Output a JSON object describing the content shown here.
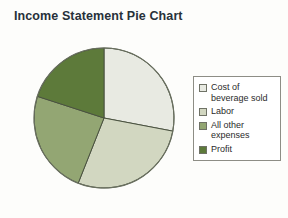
{
  "chart_data": {
    "type": "pie",
    "title": "Income Statement Pie Chart",
    "xlabel": "",
    "ylabel": "",
    "legend_position": "right",
    "grid": false,
    "start_angle_deg": 0,
    "direction": "clockwise",
    "categories": [
      "Cost of beverage sold",
      "Labor",
      "All other expenses",
      "Profit"
    ],
    "values": [
      28,
      28,
      24,
      20
    ],
    "slices": [
      {
        "label": "Cost of beverage sold",
        "value": 28,
        "color": "#e8eae2",
        "start_deg": 0,
        "end_deg": 100.8
      },
      {
        "label": "Labor",
        "value": 28,
        "color": "#d2d7c1",
        "start_deg": 100.8,
        "end_deg": 201.6
      },
      {
        "label": "All other expenses",
        "value": 24,
        "color": "#93a673",
        "start_deg": 201.6,
        "end_deg": 288.0
      },
      {
        "label": "Profit",
        "value": 20,
        "color": "#5d7a3a",
        "start_deg": 288.0,
        "end_deg": 360
      }
    ]
  },
  "title": {
    "text": "Income Statement Pie Chart"
  },
  "legend": {
    "items": [
      {
        "label": "Cost of beverage sold",
        "color": "#e8eae2",
        "swatch_name": "legend-swatch-cost-of-beverage-sold"
      },
      {
        "label": "Labor",
        "color": "#d2d7c1",
        "swatch_name": "legend-swatch-labor"
      },
      {
        "label": "All other expenses",
        "color": "#93a673",
        "swatch_name": "legend-swatch-all-other-expenses"
      },
      {
        "label": "Profit",
        "color": "#5d7a3a",
        "swatch_name": "legend-swatch-profit"
      }
    ]
  },
  "style": {
    "slice_outline": "#4a5240",
    "pie_outline": "#6a7060",
    "legend_border": "#8d8d85",
    "background": "#fdfdfb",
    "title_color": "#27313a"
  }
}
